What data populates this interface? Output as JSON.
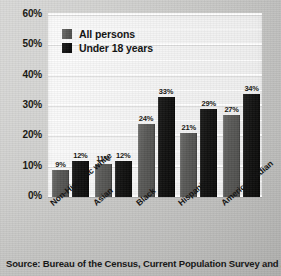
{
  "chart_data": {
    "type": "bar",
    "title": "",
    "xlabel": "",
    "ylabel": "",
    "ylim": [
      0,
      60
    ],
    "y_unit": "%",
    "grid": true,
    "grid_major_step": 10,
    "grid_minor_step": 5,
    "legend_position": "top-left",
    "categories": [
      "Non-Hispanic white",
      "Asian",
      "Black",
      "Hispanic",
      "American Indian"
    ],
    "series": [
      {
        "name": "All persons",
        "color": "#575755",
        "values": [
          9,
          11,
          24,
          21,
          27
        ]
      },
      {
        "name": "Under 18 years",
        "color": "#101010",
        "values": [
          12,
          12,
          33,
          29,
          34
        ]
      }
    ],
    "value_labels": {
      "all_persons": [
        "9%",
        "11%",
        "24%",
        "21%",
        "27%"
      ],
      "under_18_years": [
        "12%",
        "12%",
        "33%",
        "29%",
        "34%"
      ]
    },
    "ytick_labels": [
      "60%",
      "50%",
      "40%",
      "30%",
      "20%",
      "10%",
      "0%"
    ],
    "ytick_values": [
      60,
      50,
      40,
      30,
      20,
      10,
      0
    ]
  },
  "legend": {
    "items": [
      {
        "label": "All persons"
      },
      {
        "label": "Under 18 years"
      }
    ]
  },
  "source": {
    "note": "Source: Bureau of the Census, Current Population Survey and American"
  },
  "colors": {
    "all_persons": "#575755",
    "under_18_years": "#101010",
    "page_background": "#c6c6c4",
    "plot_background": "#f4f4f4",
    "gridline": "#ffffff",
    "text": "#101010"
  }
}
